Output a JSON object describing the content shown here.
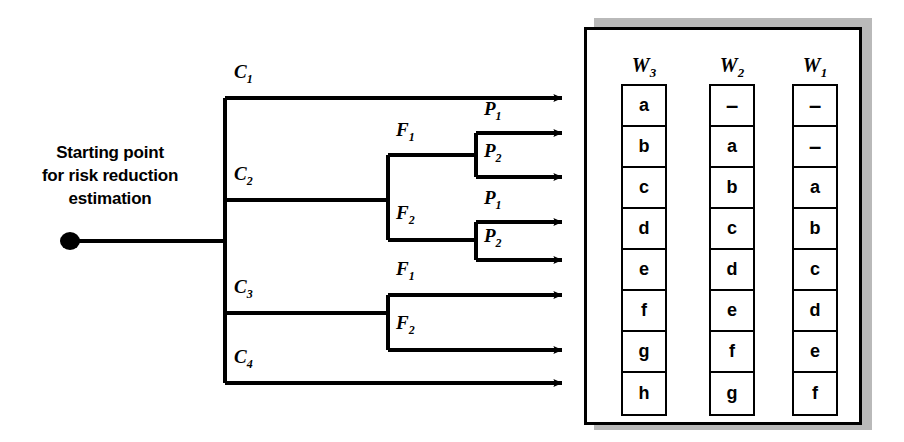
{
  "diagram": {
    "title_text": "Starting point for risk reduction estimation",
    "start_label_lines": [
      "Starting point",
      "for risk reduction",
      "estimation"
    ],
    "root_node_name": "start-dot"
  },
  "tree": {
    "level1": [
      {
        "id": "C1",
        "label": "C",
        "sub": "1"
      },
      {
        "id": "C2",
        "label": "C",
        "sub": "2"
      },
      {
        "id": "C3",
        "label": "C",
        "sub": "3"
      },
      {
        "id": "C4",
        "label": "C",
        "sub": "4"
      }
    ],
    "level2": [
      {
        "id": "C2F1",
        "label": "F",
        "sub": "1"
      },
      {
        "id": "C2F2",
        "label": "F",
        "sub": "2"
      },
      {
        "id": "C3F1",
        "label": "F",
        "sub": "1"
      },
      {
        "id": "C3F2",
        "label": "F",
        "sub": "2"
      }
    ],
    "level3": [
      {
        "id": "C2F1P1",
        "label": "P",
        "sub": "1"
      },
      {
        "id": "C2F1P2",
        "label": "P",
        "sub": "2"
      },
      {
        "id": "C2F2P1",
        "label": "P",
        "sub": "1"
      },
      {
        "id": "C2F2P2",
        "label": "P",
        "sub": "2"
      }
    ],
    "outcome_count": 8
  },
  "panel": {
    "columns": [
      {
        "header": "W",
        "header_sub": "3",
        "name": "column-w3",
        "cells": [
          "a",
          "b",
          "c",
          "d",
          "e",
          "f",
          "g",
          "h"
        ]
      },
      {
        "header": "W",
        "header_sub": "2",
        "name": "column-w2",
        "cells": [
          "–",
          "a",
          "b",
          "c",
          "d",
          "e",
          "f",
          "g"
        ]
      },
      {
        "header": "W",
        "header_sub": "1",
        "name": "column-w1",
        "cells": [
          "–",
          "–",
          "a",
          "b",
          "c",
          "d",
          "e",
          "f"
        ]
      }
    ]
  },
  "colors": {
    "line": "#000000",
    "background": "#ffffff",
    "shadow": "#b9b9b9"
  }
}
